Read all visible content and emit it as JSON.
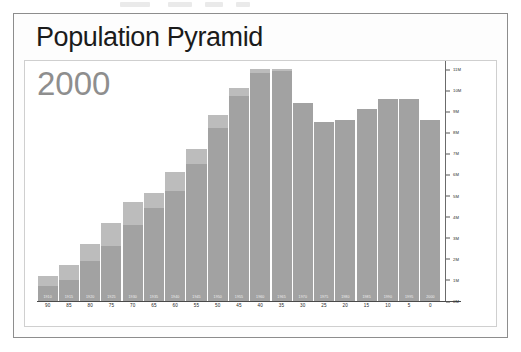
{
  "document": {
    "title_text": "Population Pyramid",
    "year_watermark": "2000"
  },
  "chart_data": {
    "type": "bar",
    "title": "Population Pyramid",
    "subtitle": "2000",
    "xlabel": "",
    "ylabel": "",
    "ylim": [
      0,
      11
    ],
    "y_unit": "M",
    "grid": false,
    "legend": "none",
    "orientation": "vertical",
    "stacked": true,
    "y_ticks": [
      "11M",
      "10M",
      "9M",
      "8M",
      "7M",
      "6M",
      "5M",
      "4M",
      "3M",
      "2M",
      "1M",
      "0M"
    ],
    "y_tick_values": [
      11,
      10,
      9,
      8,
      7,
      6,
      5,
      4,
      3,
      2,
      1,
      0
    ],
    "categories": [
      "90",
      "85",
      "80",
      "75",
      "70",
      "65",
      "60",
      "55",
      "50",
      "45",
      "40",
      "35",
      "30",
      "25",
      "20",
      "15",
      "10",
      "5",
      "0"
    ],
    "bar_labels": [
      "1910",
      "1915",
      "1920",
      "1925",
      "1930",
      "1935",
      "1940",
      "1945",
      "1950",
      "1955",
      "1960",
      "1965",
      "1970",
      "1975",
      "1980",
      "1985",
      "1990",
      "1995",
      "2000"
    ],
    "series": [
      {
        "name": "lower-segment",
        "color": "#a2a2a2",
        "values": [
          0.7,
          1.0,
          1.9,
          2.6,
          3.6,
          4.4,
          5.2,
          6.5,
          8.2,
          9.7,
          11.2,
          11.3,
          9.4,
          8.5,
          8.6,
          9.1,
          9.6,
          9.6,
          8.6
        ]
      },
      {
        "name": "upper-segment",
        "color": "#bcbcbc",
        "values": [
          0.5,
          0.7,
          0.8,
          1.1,
          1.1,
          0.7,
          0.9,
          0.7,
          0.6,
          0.4,
          0.2,
          0.1,
          0.0,
          0.0,
          0.0,
          0.0,
          0.0,
          0.0,
          0.0
        ]
      }
    ],
    "totals": [
      1.2,
      1.7,
      2.7,
      3.7,
      4.7,
      5.1,
      6.1,
      7.2,
      8.8,
      10.1,
      11.4,
      11.4,
      9.4,
      8.5,
      8.6,
      9.1,
      9.6,
      9.6,
      8.6
    ]
  },
  "colors": {
    "bar_body": "#a2a2a2",
    "bar_cap": "#bcbcbc",
    "frame": "#8d8d8d",
    "title_text": "#1b1b1b",
    "watermark_text": "#8e8e8e",
    "axis": "#4a4a4a"
  }
}
